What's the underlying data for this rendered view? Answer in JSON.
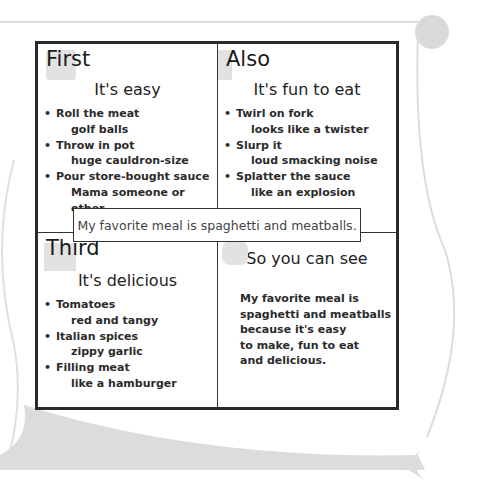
{
  "organizer": {
    "center_statement": "My favorite meal is spaghetti and meatballs.",
    "quadrants": [
      {
        "tag": "First",
        "subhead": "It's easy",
        "items": [
          {
            "main": "Roll the meat",
            "detail": "golf balls"
          },
          {
            "main": "Throw in pot",
            "detail": "huge cauldron-size"
          },
          {
            "main": "Pour store-bought sauce",
            "detail": "Mama someone or other"
          }
        ]
      },
      {
        "tag": "Also",
        "subhead": "It's fun to eat",
        "items": [
          {
            "main": "Twirl on fork",
            "detail": "looks like a twister"
          },
          {
            "main": "Slurp it",
            "detail": "loud smacking noise"
          },
          {
            "main": "Splatter the sauce",
            "detail": "like an explosion"
          }
        ]
      },
      {
        "tag": "Third",
        "subhead": "It's delicious",
        "items": [
          {
            "main": "Tomatoes",
            "detail": "red and tangy"
          },
          {
            "main": "Italian spices",
            "detail": "zippy garlic"
          },
          {
            "main": "Filling meat",
            "detail": "like a hamburger"
          }
        ]
      },
      {
        "tag": "",
        "subhead": "So you can see",
        "summary": "My favorite meal is\nspaghetti and meatballs\nbecause it's easy\nto make, fun to eat\nand delicious."
      }
    ]
  },
  "bullet": "•",
  "colors": {
    "border": "#2a2a2a",
    "scroll": "#d8d8d8",
    "puzzle": "#e2e2e2"
  }
}
